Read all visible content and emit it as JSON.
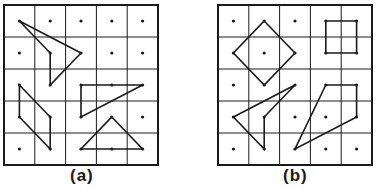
{
  "figure": {
    "grid_size": 5,
    "colors": {
      "ink": "#1a1a1a",
      "paper": "#ffffff"
    },
    "panels": [
      {
        "id": "a",
        "caption": "(a)",
        "origin": [
          4,
          5
        ],
        "cell": [
          30.8,
          32
        ],
        "dots": [
          [
            1,
            0
          ],
          [
            2,
            0
          ],
          [
            3,
            0
          ],
          [
            4,
            0
          ],
          [
            0,
            1
          ],
          [
            3,
            1
          ],
          [
            4,
            1
          ],
          [
            4,
            3
          ],
          [
            0,
            4
          ]
        ],
        "shapes": [
          {
            "name": "concave-quadrilateral",
            "points": [
              [
                0,
                0
              ],
              [
                2,
                1
              ],
              [
                1,
                2
              ],
              [
                1,
                1
              ]
            ]
          },
          {
            "name": "parallelogram",
            "points": [
              [
                0,
                2
              ],
              [
                1,
                3
              ],
              [
                1,
                4
              ],
              [
                0,
                3
              ]
            ]
          },
          {
            "name": "right-triangle",
            "points": [
              [
                2,
                2
              ],
              [
                3,
                2
              ],
              [
                4,
                2
              ],
              [
                2,
                3
              ]
            ]
          },
          {
            "name": "isosceles-triangle",
            "points": [
              [
                3,
                3
              ],
              [
                4,
                4
              ],
              [
                3,
                4
              ],
              [
                2,
                4
              ]
            ]
          }
        ]
      },
      {
        "id": "b",
        "caption": "(b)",
        "origin": [
          218,
          5
        ],
        "cell": [
          30.8,
          32
        ],
        "dots": [
          [
            0,
            0
          ],
          [
            2,
            0
          ],
          [
            1,
            1
          ],
          [
            0,
            2
          ],
          [
            2,
            3
          ],
          [
            3,
            3
          ],
          [
            0,
            4
          ],
          [
            3,
            4
          ],
          [
            4,
            4
          ]
        ],
        "shapes": [
          {
            "name": "diamond",
            "points": [
              [
                1,
                0
              ],
              [
                2,
                1
              ],
              [
                1,
                2
              ],
              [
                0,
                1
              ]
            ]
          },
          {
            "name": "square",
            "points": [
              [
                3,
                0
              ],
              [
                4,
                0
              ],
              [
                4,
                1
              ],
              [
                3,
                1
              ]
            ]
          },
          {
            "name": "concave-quadrilateral",
            "points": [
              [
                2,
                2
              ],
              [
                0,
                3
              ],
              [
                1,
                4
              ],
              [
                1,
                3
              ]
            ]
          },
          {
            "name": "quadrilateral",
            "points": [
              [
                3,
                2
              ],
              [
                4,
                2
              ],
              [
                4,
                3
              ],
              [
                2,
                4
              ]
            ]
          }
        ]
      }
    ]
  }
}
